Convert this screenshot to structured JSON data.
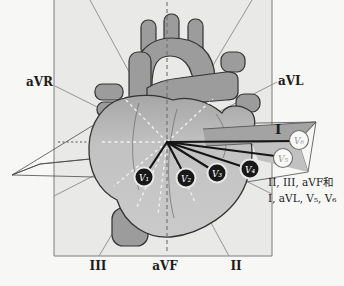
{
  "labels": {
    "avr": "aVR",
    "avl": "aVL",
    "lead_i": "I",
    "lead_ii": "II",
    "lead_iii": "III",
    "avf": "aVF"
  },
  "electrodes": {
    "v1": "V₁",
    "v2": "V₂",
    "v3": "V₃",
    "v4": "V₄",
    "v5": "V₅",
    "v6": "V₆"
  },
  "caption": {
    "line1": "II, III, aVF和",
    "line2": "I, aVL, V₅, V₆"
  },
  "colors": {
    "background": "#f7f7f5",
    "frontal_plane": "#e9e9e7",
    "horizontal_plane_dark": "#a3a3a3",
    "horizontal_plane_light": "#c1c1c1",
    "vessels": "#9c9c9c",
    "heart_body": "#c3c3c3",
    "electrode_dark": "#181818",
    "lead_line": "#151515"
  }
}
